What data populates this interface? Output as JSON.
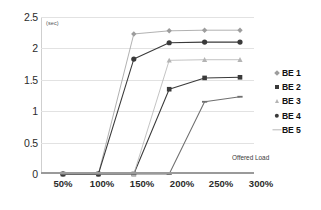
{
  "chart_data": {
    "type": "line",
    "title": "",
    "xlabel": "Offered Load",
    "ylabel": "(sec)",
    "unit_label": "(sec)",
    "categories": [
      "50%",
      "100%",
      "150%",
      "200%",
      "250%",
      "300%"
    ],
    "ylim": [
      0,
      2.5
    ],
    "yticks": [
      "0",
      "0.5",
      "1",
      "1.5",
      "2",
      "2.5"
    ],
    "ytick_values": [
      0,
      0.5,
      1,
      1.5,
      2,
      2.5
    ],
    "grid": true,
    "legend_position": "right",
    "series": [
      {
        "name": "BE 1",
        "marker": "diamond",
        "color": "#9d9d9d",
        "values": [
          0,
          0,
          2.23,
          2.28,
          2.29,
          2.29
        ]
      },
      {
        "name": "BE 2",
        "marker": "square",
        "color": "#3a3a3a",
        "values": [
          0,
          0,
          0,
          1.35,
          1.53,
          1.54
        ]
      },
      {
        "name": "BE 3",
        "marker": "triangle",
        "color": "#b4b4b4",
        "values": [
          0,
          0,
          0,
          1.81,
          1.82,
          1.82
        ]
      },
      {
        "name": "BE 4",
        "marker": "circle",
        "color": "#3a3a3a",
        "values": [
          0,
          0,
          1.83,
          2.09,
          2.1,
          2.1
        ]
      },
      {
        "name": "BE 5",
        "marker": "dash",
        "color": "#6f6f6f",
        "values": [
          0,
          0,
          0,
          0,
          1.15,
          1.23
        ]
      }
    ]
  },
  "legend": {
    "items": [
      {
        "label": "BE 1"
      },
      {
        "label": "BE 2"
      },
      {
        "label": "BE 3"
      },
      {
        "label": "BE 4"
      },
      {
        "label": "BE 5"
      }
    ]
  },
  "axes": {
    "x_title": "Offered Load",
    "y_unit": "(sec)"
  }
}
